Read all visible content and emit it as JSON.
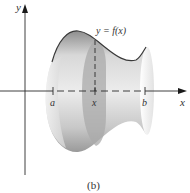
{
  "figure": {
    "caption": "(b)",
    "curve_label": "y = f(x)",
    "axes": {
      "x_label": "x",
      "y_label": "y"
    },
    "ticks": [
      {
        "label": "a",
        "x": 53
      },
      {
        "label": "x",
        "x": 95
      },
      {
        "label": "b",
        "x": 145
      }
    ],
    "colors": {
      "solid_light": "#e6e6e6",
      "solid_mid": "#c4c4c4",
      "solid_dark": "#9a9a9a",
      "cross_section": "#a8a8a8",
      "curve": "#3a3a3a",
      "axis": "#2a2a2a"
    }
  }
}
